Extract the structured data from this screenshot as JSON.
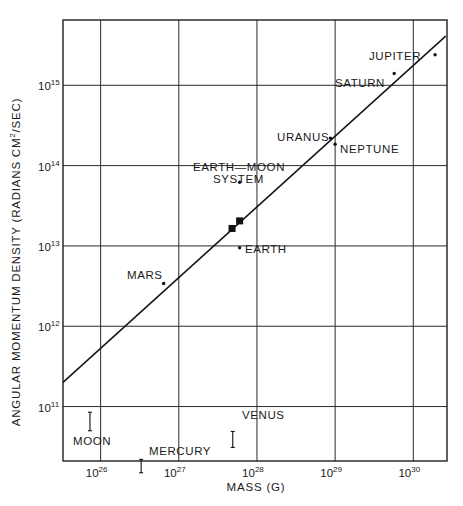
{
  "chart_data": {
    "type": "scatter",
    "title": "",
    "xlabel": "MASS (G)",
    "ylabel": "ANGULAR MOMENTUM DENSITY (RADIANS CM²/SEC)",
    "x_scale": "log",
    "y_scale": "log",
    "xlim": [
      3.3e+25,
      2.7e+30
    ],
    "ylim": [
      21000000000.0,
      6500000000000000.0
    ],
    "grid": true,
    "legend": "none",
    "x_ticks": [
      {
        "base": "10",
        "exp": "26",
        "value": 1e+26
      },
      {
        "base": "10",
        "exp": "27",
        "value": 1e+27
      },
      {
        "base": "10",
        "exp": "28",
        "value": 1e+28
      },
      {
        "base": "10",
        "exp": "29",
        "value": 1e+29
      },
      {
        "base": "10",
        "exp": "30",
        "value": 1e+30
      }
    ],
    "y_ticks": [
      {
        "base": "10",
        "exp": "11",
        "value": 100000000000.0
      },
      {
        "base": "10",
        "exp": "12",
        "value": 1000000000000.0
      },
      {
        "base": "10",
        "exp": "13",
        "value": 10000000000000.0
      },
      {
        "base": "10",
        "exp": "14",
        "value": 100000000000000.0
      },
      {
        "base": "10",
        "exp": "15",
        "value": 1000000000000000.0
      }
    ],
    "fit_line": {
      "from": {
        "x": 3.3e+25,
        "y": 200000000000.0
      },
      "to": {
        "x": 2.6e+30,
        "y": 4100000000000000.0
      }
    },
    "points": [
      {
        "name": "JUPITER",
        "x": 1.9e+30,
        "y": 2400000000000000.0,
        "marker": "dot"
      },
      {
        "name": "SATURN",
        "x": 5.7e+29,
        "y": 1400000000000000.0,
        "marker": "dot"
      },
      {
        "name": "URANUS",
        "x": 8.7e+28,
        "y": 220000000000000.0,
        "marker": "dot"
      },
      {
        "name": "NEPTUNE",
        "x": 1e+29,
        "y": 185000000000000.0,
        "marker": "dot"
      },
      {
        "name": "EARTH-MOON SYSTEM",
        "x": 6e+27,
        "y": 62000000000000.0,
        "marker": "dot"
      },
      {
        "name": "EARTH",
        "x": 6e+27,
        "y": 9500000000000.0,
        "marker": "dot"
      },
      {
        "name": "MARS",
        "x": 6.4e+26,
        "y": 3400000000000.0,
        "marker": "dot"
      },
      {
        "name": "",
        "x": 4.8e+27,
        "y": 16500000000000.0,
        "marker": "square"
      },
      {
        "name": "",
        "x": 6e+27,
        "y": 20500000000000.0,
        "marker": "square"
      }
    ],
    "upper_limits": [
      {
        "name": "MOON",
        "x": 7.3e+25,
        "y_range": [
          50000000000.0,
          85000000000.0
        ]
      },
      {
        "name": "MERCURY",
        "x": 3.3e+26,
        "y_range": [
          15000000000.0,
          22000000000.0
        ]
      },
      {
        "name": "VENUS",
        "x": 4.9e+27,
        "y_range": [
          31000000000.0,
          49000000000.0
        ]
      }
    ]
  },
  "labels": {
    "jupiter": "JUPITER",
    "saturn": "SATURN",
    "uranus": "URANUS",
    "neptune": "NEPTUNE",
    "earth_moon_1": "EARTH—MOON",
    "earth_moon_2": "SYSTEM",
    "earth": "EARTH",
    "mars": "MARS",
    "moon": "MOON",
    "mercury": "MERCURY",
    "venus": "VENUS"
  },
  "axes": {
    "x_title": "MASS (G)",
    "y_title": "ANGULAR MOMENTUM DENSITY (RADIANS CM",
    "y_title_sup": "2",
    "y_title_tail": "/SEC)"
  }
}
